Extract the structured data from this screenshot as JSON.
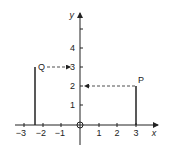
{
  "diagram": {
    "axes": {
      "x_label": "x",
      "y_label": "y",
      "origin_label": "O",
      "x_ticks": [
        "−3",
        "−2",
        "−1",
        "1",
        "2",
        "3"
      ],
      "y_ticks": [
        "1",
        "2",
        "3",
        "4"
      ]
    },
    "points": [
      {
        "label": "Q",
        "x": -2.5,
        "y": 3,
        "arrow_to_axis": "y",
        "arrow_value": "3"
      },
      {
        "label": "P",
        "x": 3,
        "y": 2,
        "arrow_to_axis": "y",
        "arrow_value": "2"
      }
    ],
    "colors": {
      "line": "#222222",
      "background": "#ffffff"
    }
  }
}
